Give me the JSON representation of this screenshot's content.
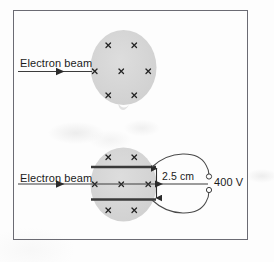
{
  "figure": {
    "border_color": "#6b6b73",
    "region_fill": "#d4d4d4",
    "plate_color": "#3a3a3a",
    "line_color": "#3c3c3c",
    "text_color": "#1b1b1b"
  },
  "labels": {
    "beam_top": "Electron beam",
    "beam_bottom": "Electron beam",
    "plate_gap": "2.5 cm",
    "voltage": "400 V"
  },
  "diagram_data": {
    "type": "physics-schematic",
    "panels": [
      {
        "id": "upper",
        "description": "Circular region of uniform magnetic field into the page; electron beam enters horizontally and passes straight through",
        "field_symbol": "x",
        "field_direction": "into-page",
        "field_marks": 7,
        "plates": 0,
        "beam_entry": "left"
      },
      {
        "id": "lower",
        "description": "Same circular magnetic field region with two horizontal parallel plates connected to a 400 V supply; electron beam enters between the plates",
        "field_symbol": "x",
        "field_direction": "into-page",
        "field_marks": 7,
        "plates": 2,
        "plate_separation": "2.5 cm",
        "supply_voltage": "400 V",
        "beam_entry": "left"
      }
    ],
    "field_mark_rows": {
      "top_row": 2,
      "middle_row": 3,
      "bottom_row": 2
    },
    "terminals": 2
  }
}
